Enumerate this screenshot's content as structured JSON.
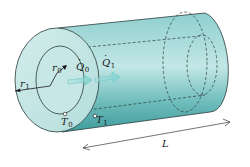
{
  "diagram": {
    "colors": {
      "background": "#ffffff",
      "body_fill_light": "#bfe3e3",
      "body_fill_mid": "#7cc4c4",
      "body_fill_dark": "#3f9c9c",
      "face_fill": "#c4e6e4",
      "outline": "#2a3c3c",
      "arrow": "#7fd0d0"
    },
    "labels": {
      "outer_radius": {
        "symbol": "r",
        "sub": "1"
      },
      "inner_radius": {
        "symbol": "r",
        "sub": "0"
      },
      "heat_in": {
        "symbol": "Q",
        "sub": "0"
      },
      "heat_out": {
        "symbol": "Q",
        "sub": "1"
      },
      "inner_temp": {
        "symbol": "T",
        "sub": "0"
      },
      "outer_temp": {
        "symbol": "T",
        "sub": "1"
      },
      "length": {
        "symbol": "L"
      }
    }
  }
}
